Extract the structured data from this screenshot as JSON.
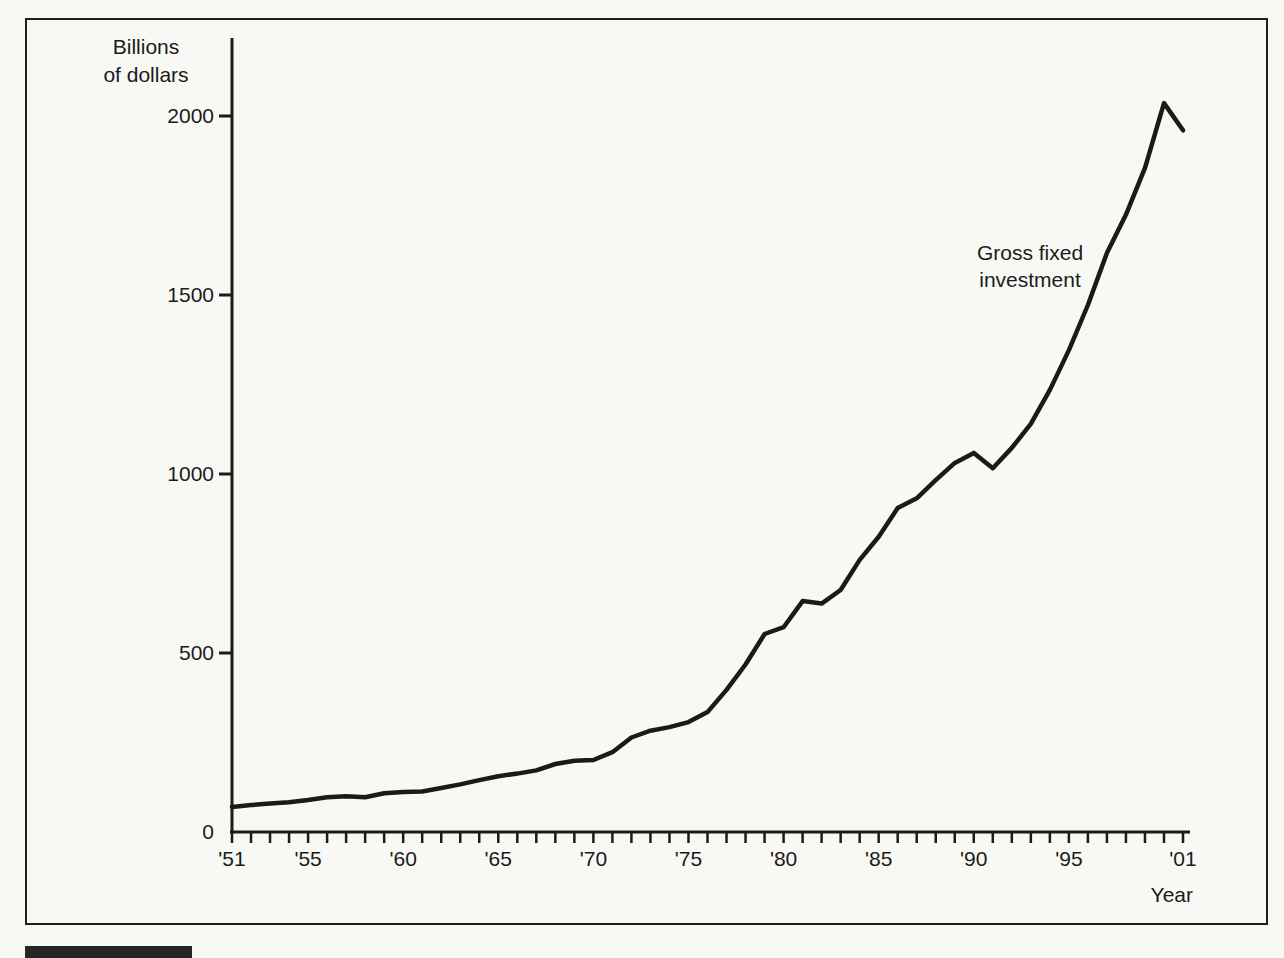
{
  "figure": {
    "ylabel": "Billions\nof dollars",
    "xlabel": "Year",
    "annotation": "Gross fixed\ninvestment"
  },
  "colors": {
    "background": "#f8f8f5",
    "ink": "#1b1b1b",
    "line": "#1a1a1a",
    "frame_border": "#1f1f1f",
    "figure_bar": "#262626"
  },
  "chart_data": {
    "type": "line",
    "title": "",
    "xlabel": "Year",
    "ylabel": "Billions of dollars",
    "xlim": [
      1951,
      2001
    ],
    "ylim": [
      0,
      2220
    ],
    "grid": false,
    "legend_position": "inline-annotation",
    "annotation": "Gross fixed investment",
    "yticks": [
      0,
      500,
      1000,
      1500,
      2000
    ],
    "xticks": [
      {
        "year": 1951,
        "label": "'51"
      },
      {
        "year": 1955,
        "label": "'55"
      },
      {
        "year": 1960,
        "label": "'60"
      },
      {
        "year": 1965,
        "label": "'65"
      },
      {
        "year": 1970,
        "label": "'70"
      },
      {
        "year": 1975,
        "label": "'75"
      },
      {
        "year": 1980,
        "label": "'80"
      },
      {
        "year": 1985,
        "label": "'85"
      },
      {
        "year": 1990,
        "label": "'90"
      },
      {
        "year": 1995,
        "label": "'95"
      },
      {
        "year": 2001,
        "label": "'01"
      }
    ],
    "minor_xtick_every_years": 1,
    "series": [
      {
        "name": "Gross fixed investment",
        "x": [
          1951,
          1952,
          1953,
          1954,
          1955,
          1956,
          1957,
          1958,
          1959,
          1960,
          1961,
          1962,
          1963,
          1964,
          1965,
          1966,
          1967,
          1968,
          1969,
          1970,
          1971,
          1972,
          1973,
          1974,
          1975,
          1976,
          1977,
          1978,
          1979,
          1980,
          1981,
          1982,
          1983,
          1984,
          1985,
          1986,
          1987,
          1988,
          1989,
          1990,
          1991,
          1992,
          1993,
          1994,
          1995,
          1996,
          1997,
          1998,
          1999,
          2000,
          2001
        ],
        "values": [
          70,
          75,
          80,
          83,
          89,
          97,
          100,
          97,
          108,
          112,
          113,
          123,
          133,
          145,
          156,
          163,
          172,
          190,
          199,
          201,
          223,
          264,
          283,
          293,
          307,
          335,
          397,
          468,
          553,
          572,
          645,
          638,
          676,
          760,
          825,
          905,
          932,
          983,
          1031,
          1059,
          1016,
          1073,
          1140,
          1235,
          1346,
          1472,
          1617,
          1724,
          1855,
          2036,
          1960
        ]
      }
    ]
  }
}
